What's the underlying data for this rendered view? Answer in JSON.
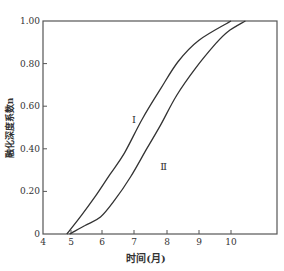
{
  "chart_data": {
    "type": "line",
    "title": "",
    "xlabel": "时间(月)",
    "ylabel": "融化深度系数n",
    "xlim": [
      4,
      11
    ],
    "ylim": [
      0,
      1.0
    ],
    "x_ticks": [
      {
        "value": 4,
        "label": "4",
        "px": 43
      },
      {
        "value": 5,
        "label": "5",
        "px": 71
      },
      {
        "value": 6,
        "label": "6",
        "px": 102
      },
      {
        "value": 7,
        "label": "7",
        "px": 134
      },
      {
        "value": 8,
        "label": "8",
        "px": 167
      },
      {
        "value": 9,
        "label": "9",
        "px": 199
      },
      {
        "value": 10,
        "label": "10",
        "px": 231
      }
    ],
    "y_ticks": [
      {
        "value": 0,
        "label": "0"
      },
      {
        "value": 0.2,
        "label": "0.20"
      },
      {
        "value": 0.4,
        "label": "0.40"
      },
      {
        "value": 0.6,
        "label": "0.60"
      },
      {
        "value": 0.8,
        "label": "0.80"
      },
      {
        "value": 1.0,
        "label": "1.00"
      }
    ],
    "grid": false,
    "legend": "none (curves labeled inline)",
    "series": [
      {
        "name": "Ⅰ",
        "x": [
          4.85,
          5.35,
          5.8,
          6.25,
          6.7,
          7.25,
          7.8,
          8.35,
          9.0,
          10.0
        ],
        "y": [
          0,
          0.09,
          0.18,
          0.28,
          0.38,
          0.54,
          0.68,
          0.81,
          0.91,
          1.0
        ],
        "label_pos": [
          7.0,
          0.52
        ]
      },
      {
        "name": "Ⅱ",
        "x": [
          4.95,
          5.45,
          5.95,
          6.4,
          6.9,
          7.35,
          7.8,
          8.3,
          8.9,
          9.5,
          9.9,
          10.45
        ],
        "y": [
          0,
          0.04,
          0.08,
          0.16,
          0.27,
          0.39,
          0.51,
          0.65,
          0.78,
          0.89,
          0.95,
          1.0
        ],
        "label_pos": [
          7.9,
          0.3
        ]
      }
    ]
  }
}
